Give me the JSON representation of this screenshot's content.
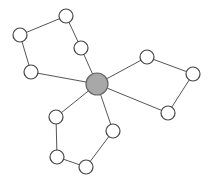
{
  "diagram": {
    "type": "graph",
    "hub": {
      "id": "hub",
      "x": 97,
      "y": 84,
      "r": 11,
      "fill": "#a8a8a8"
    },
    "node_radius": 7,
    "node_fill": "#ffffff",
    "nodes": [
      {
        "id": "a1",
        "x": 31,
        "y": 72
      },
      {
        "id": "a2",
        "x": 20,
        "y": 35
      },
      {
        "id": "a3",
        "x": 66,
        "y": 16
      },
      {
        "id": "a4",
        "x": 81,
        "y": 48
      },
      {
        "id": "b1",
        "x": 147,
        "y": 57
      },
      {
        "id": "b2",
        "x": 193,
        "y": 74
      },
      {
        "id": "b3",
        "x": 168,
        "y": 113
      },
      {
        "id": "c1",
        "x": 113,
        "y": 131
      },
      {
        "id": "c2",
        "x": 86,
        "y": 167
      },
      {
        "id": "c3",
        "x": 57,
        "y": 157
      },
      {
        "id": "c4",
        "x": 56,
        "y": 117
      }
    ],
    "edges": [
      [
        "hub",
        "a1"
      ],
      [
        "a1",
        "a2"
      ],
      [
        "a2",
        "a3"
      ],
      [
        "a3",
        "a4"
      ],
      [
        "a4",
        "hub"
      ],
      [
        "hub",
        "b1"
      ],
      [
        "b1",
        "b2"
      ],
      [
        "b2",
        "b3"
      ],
      [
        "b3",
        "hub"
      ],
      [
        "hub",
        "c1"
      ],
      [
        "c1",
        "c2"
      ],
      [
        "c2",
        "c3"
      ],
      [
        "c3",
        "c4"
      ],
      [
        "c4",
        "hub"
      ]
    ]
  }
}
